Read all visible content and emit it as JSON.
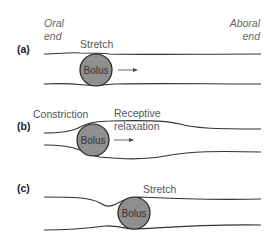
{
  "labels": {
    "oral_end_line1": "Oral",
    "oral_end_line2": "end",
    "aboral_end_line1": "Aboral",
    "aboral_end_line2": "end"
  },
  "panels": [
    {
      "id": "a",
      "label": "(a)",
      "annotations": [
        "Stretch"
      ],
      "bolus": "Bolus",
      "arrow": true
    },
    {
      "id": "b",
      "label": "(b)",
      "annotations": [
        "Constriction",
        "Receptive",
        "relaxation"
      ],
      "bolus": "Bolus",
      "arrow": true
    },
    {
      "id": "c",
      "label": "(c)",
      "annotations": [
        "Stretch"
      ],
      "bolus": "Bolus",
      "arrow": false
    }
  ],
  "colors": {
    "bolus_fill": "#8f8f8f",
    "line": "#333333",
    "text": "#555555"
  }
}
